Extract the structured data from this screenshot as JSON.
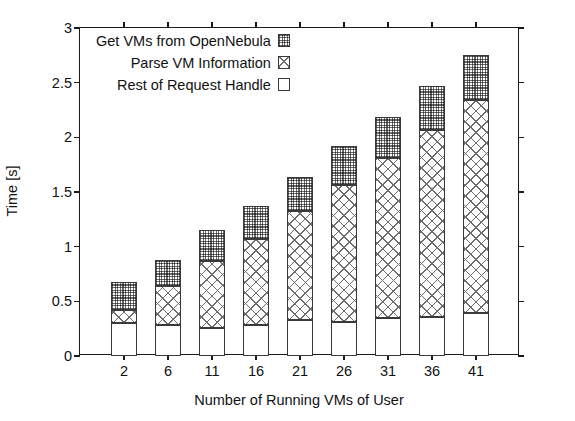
{
  "chart_data": {
    "type": "bar",
    "stacked": true,
    "title": "",
    "xlabel": "Number of Running VMs of User",
    "ylabel": "Time [s]",
    "categories": [
      "2",
      "6",
      "11",
      "16",
      "21",
      "26",
      "31",
      "36",
      "41"
    ],
    "ylim": [
      0,
      3
    ],
    "yticks": [
      "0",
      "0.5",
      "1",
      "1.5",
      "2",
      "2.5",
      "3"
    ],
    "ytick_values": [
      0,
      0.5,
      1,
      1.5,
      2,
      2.5,
      3
    ],
    "grid": false,
    "legend_position": "top-left inside plot",
    "series": [
      {
        "name": "Rest of Request Handle",
        "fill": "blank",
        "values": [
          0.3,
          0.28,
          0.26,
          0.28,
          0.33,
          0.31,
          0.35,
          0.36,
          0.39
        ]
      },
      {
        "name": "Parse VM Information",
        "fill": "cross-hatch",
        "values": [
          0.12,
          0.36,
          0.61,
          0.79,
          1.0,
          1.25,
          1.46,
          1.71,
          1.95
        ]
      },
      {
        "name": "Get VMs from OpenNebula",
        "fill": "dots",
        "values": [
          0.26,
          0.24,
          0.28,
          0.3,
          0.31,
          0.36,
          0.38,
          0.4,
          0.41
        ]
      }
    ],
    "cumulative_tops": {
      "rest_of_request_handle": [
        0.3,
        0.28,
        0.26,
        0.28,
        0.33,
        0.31,
        0.35,
        0.36,
        0.39
      ],
      "parse_vm_information": [
        0.42,
        0.64,
        0.87,
        1.07,
        1.33,
        1.56,
        1.81,
        2.07,
        2.34
      ],
      "total": [
        0.68,
        0.88,
        1.15,
        1.37,
        1.64,
        1.92,
        2.19,
        2.47,
        2.75
      ]
    }
  },
  "legend": {
    "items": [
      {
        "label": "Get VMs from OpenNebula",
        "fill": "dots"
      },
      {
        "label": "Parse VM Information",
        "fill": "cross-hatch"
      },
      {
        "label": "Rest of Request Handle",
        "fill": "blank"
      }
    ]
  },
  "colors": {
    "axis": "#1a1a1a",
    "bar_outline": "#3a3a3a",
    "pattern": "#6d6d6d",
    "background": "#ffffff"
  }
}
